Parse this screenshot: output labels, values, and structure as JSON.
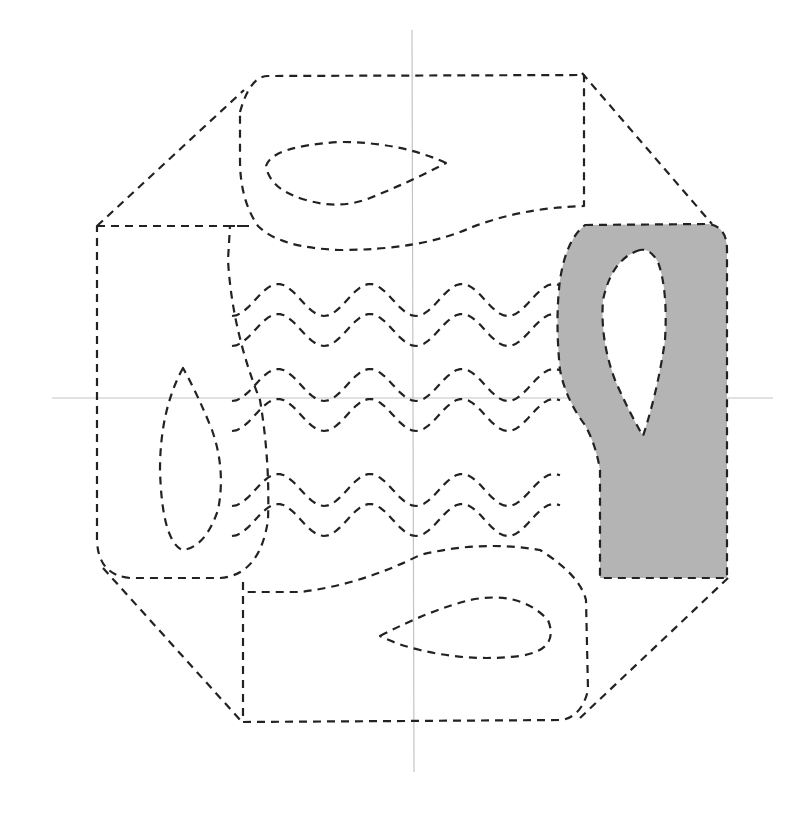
{
  "diagram": {
    "title": "",
    "colors": {
      "stroke": "#222222",
      "axis": "#c4c4c4",
      "fill": "#b4b4b4",
      "background": "#ffffff"
    },
    "axes": {
      "horizontal_y": 398,
      "vertical_x": 412
    },
    "wave_rows": [
      {
        "y": 300,
        "amp": 16
      },
      {
        "y": 330,
        "amp": 16
      },
      {
        "y": 385,
        "amp": 16
      },
      {
        "y": 415,
        "amp": 16
      },
      {
        "y": 490,
        "amp": 16
      },
      {
        "y": 520,
        "amp": 16
      }
    ]
  }
}
